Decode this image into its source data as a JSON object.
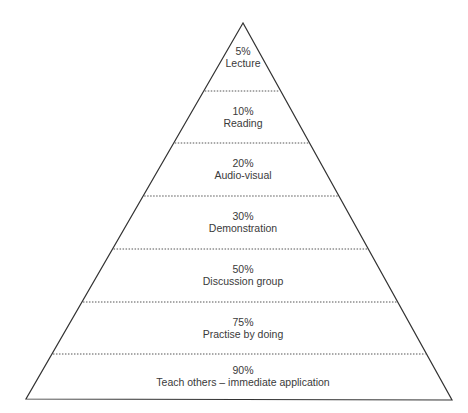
{
  "diagram": {
    "type": "pyramid",
    "apex": [
      243,
      23
    ],
    "base_left": [
      26,
      399
    ],
    "base_right": [
      452,
      400
    ],
    "divider_ys": [
      91,
      143,
      196,
      249,
      302,
      354
    ],
    "line_color": "#333333",
    "levels": [
      {
        "percent": "5%",
        "label": "Lecture",
        "cy": 57
      },
      {
        "percent": "10%",
        "label": "Reading",
        "cy": 117
      },
      {
        "percent": "20%",
        "label": "Audio-visual",
        "cy": 169
      },
      {
        "percent": "30%",
        "label": "Demonstration",
        "cy": 222
      },
      {
        "percent": "50%",
        "label": "Discussion group",
        "cy": 275
      },
      {
        "percent": "75%",
        "label": "Practise by doing",
        "cy": 328
      },
      {
        "percent": "90%",
        "label": "Teach others – immediate application",
        "cy": 376
      }
    ]
  }
}
